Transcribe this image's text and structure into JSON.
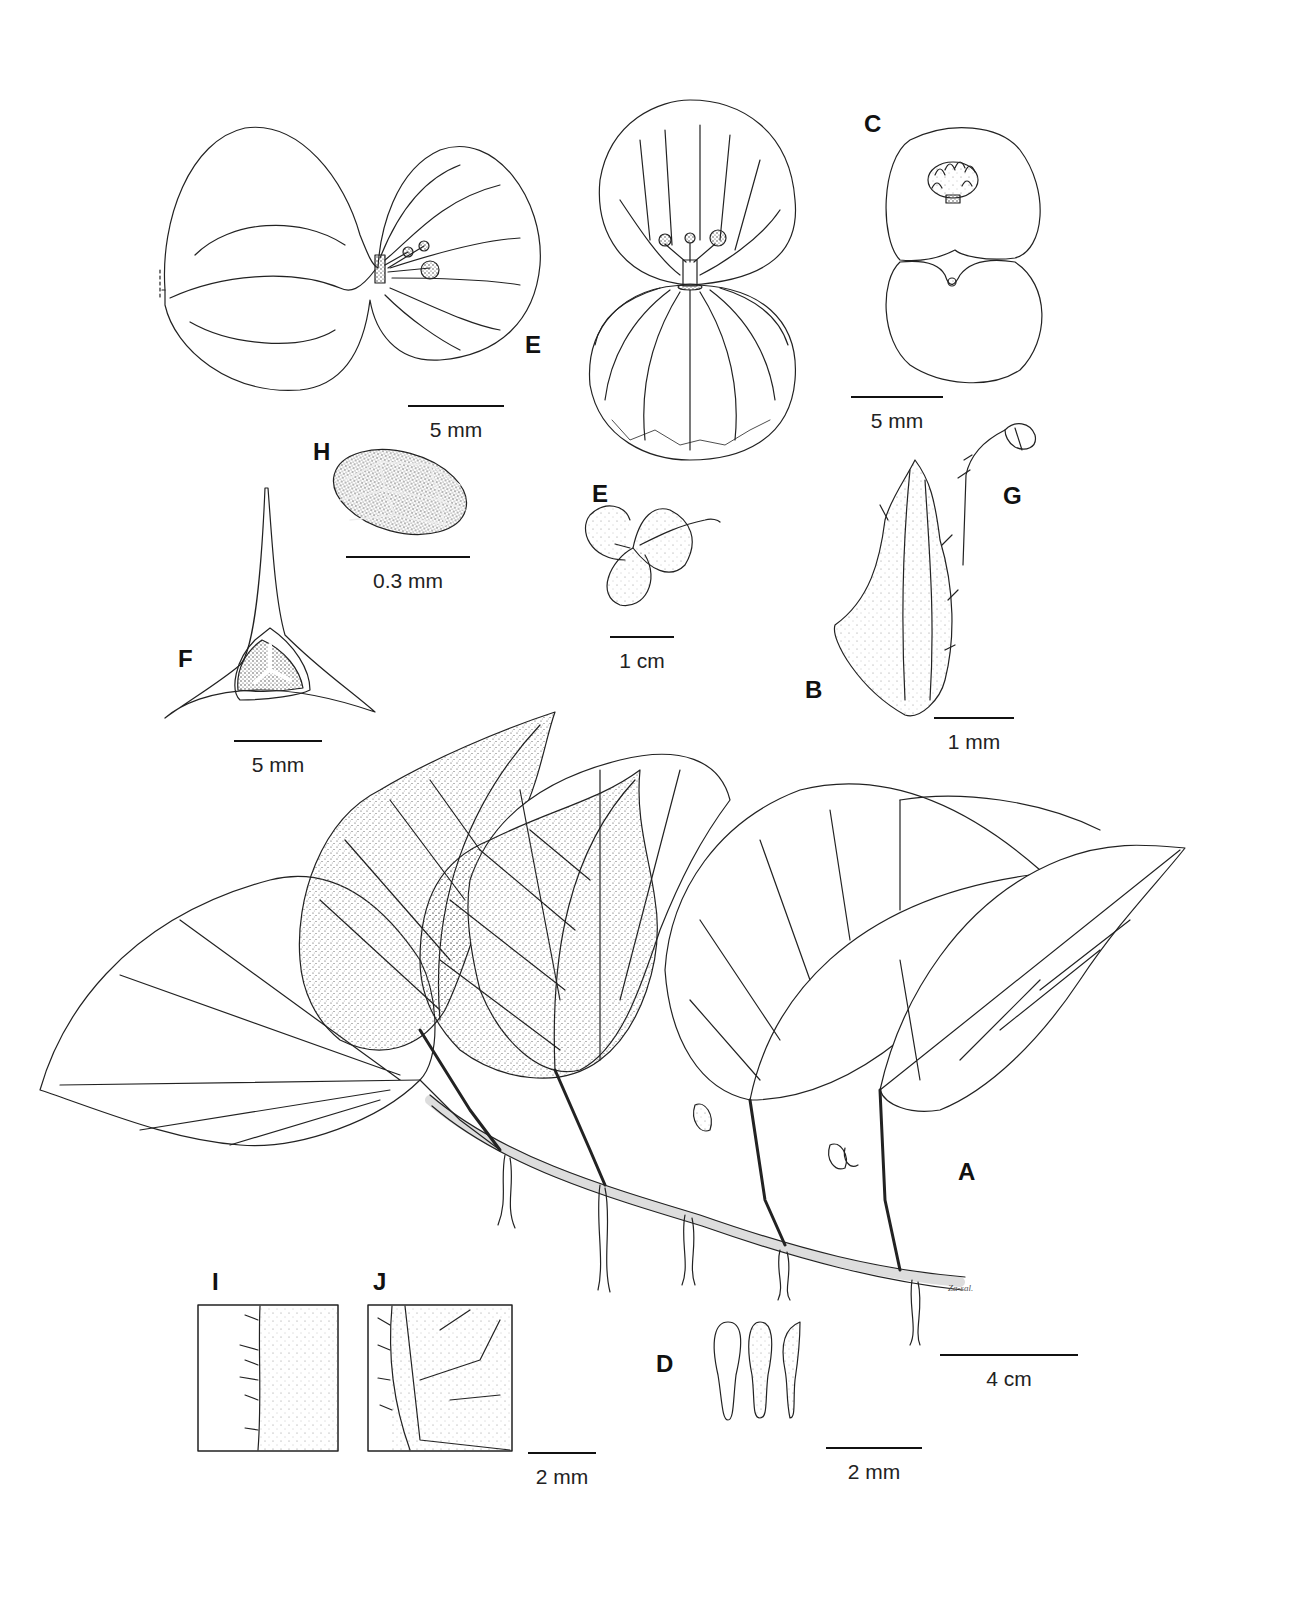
{
  "figure": {
    "type": "botanical-illustration-plate",
    "panels": {
      "A": {
        "label": "A",
        "subject": "habit, creeping rhizome with leaves, roots and inflorescences"
      },
      "B": {
        "label": "B",
        "subject": "stipule"
      },
      "C": {
        "label": "C",
        "subject": "staminate flower"
      },
      "D": {
        "label": "D",
        "subject": "stamens"
      },
      "E_top_left": {
        "label": "E",
        "subject": "pistillate flower, side view"
      },
      "E_small": {
        "label": "E",
        "subject": "pistillate flower, whole"
      },
      "F": {
        "label": "F",
        "subject": "ovary cross-section"
      },
      "G": {
        "label": "G",
        "subject": "infructescence / fruiting pedicel"
      },
      "H": {
        "label": "H",
        "subject": "seed"
      },
      "I": {
        "label": "I",
        "subject": "leaf margin detail, upper surface"
      },
      "J": {
        "label": "J",
        "subject": "leaf venation detail, lower surface"
      }
    },
    "scale_bars": {
      "e_top": "5 mm",
      "c": "5 mm",
      "h": "0.3 mm",
      "e_small": "1 cm",
      "b": "1 mm",
      "f": "5 mm",
      "a": "4 cm",
      "ij": "2 mm",
      "d": "2 mm"
    },
    "signature": "Za-sal."
  }
}
